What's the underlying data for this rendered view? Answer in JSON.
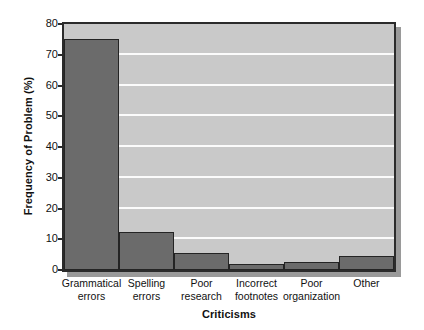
{
  "chart_data": {
    "type": "bar",
    "title": "",
    "xlabel": "Criticisms",
    "ylabel": "Frequency of Problem (%)",
    "categories": [
      "Grammatical errors",
      "Spelling errors",
      "Poor research",
      "Incorrect footnotes",
      "Poor organization",
      "Other"
    ],
    "category_lines": [
      [
        "Grammatical",
        "errors"
      ],
      [
        "Spelling",
        "errors"
      ],
      [
        "Poor",
        "research"
      ],
      [
        "Incorrect",
        "footnotes"
      ],
      [
        "Poor",
        "organization"
      ],
      [
        "Other",
        ""
      ]
    ],
    "values": [
      75,
      12.5,
      5.5,
      2,
      2.5,
      4.5
    ],
    "ylim": [
      0,
      80
    ],
    "yticks": [
      0,
      10,
      20,
      30,
      40,
      50,
      60,
      70,
      80
    ],
    "ytick_labels": [
      "0",
      "10",
      "20",
      "30",
      "40",
      "50",
      "60",
      "70",
      "80"
    ],
    "grid": true,
    "grid_axis": "y",
    "legend": null,
    "bar_gap": 0,
    "colors": {
      "bar_fill": "#6b6b6b",
      "bar_edge": "#242424",
      "plot_background": "#c9c9c9",
      "gridline": "#fbfbfb",
      "frame": "#2b2b2b",
      "shadow": "#9a9a9a",
      "text": "#111111",
      "page_background": "#ffffff"
    }
  }
}
